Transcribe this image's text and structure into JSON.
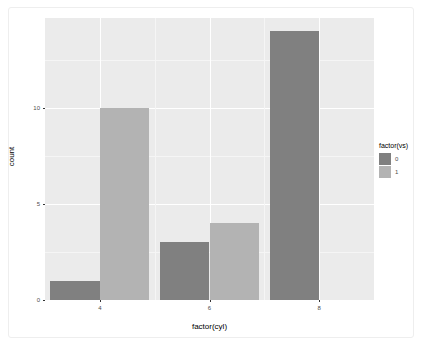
{
  "figure": {
    "background": "#ffffff",
    "panel_background": "#ebebeb",
    "grid_major_color": "#ffffff",
    "grid_minor_color": "#f5f5f5",
    "frame_border_color": "#eeeeee"
  },
  "axis": {
    "x_title": "factor(cyl)",
    "y_title": "count",
    "x_tick_labels": [
      "4",
      "6",
      "8"
    ],
    "y_tick_labels": [
      "0",
      "5",
      "10"
    ]
  },
  "legend": {
    "title": "factor(vs)",
    "position": "right",
    "items": [
      {
        "label": "0",
        "color": "#808080"
      },
      {
        "label": "1",
        "color": "#b3b3b3"
      }
    ]
  },
  "chart_data": {
    "type": "bar",
    "title": "",
    "subtitle": "",
    "xlabel": "factor(cyl)",
    "ylabel": "count",
    "categories": [
      "4",
      "6",
      "8"
    ],
    "series": [
      {
        "name": "0",
        "color": "#808080",
        "values": [
          1,
          3,
          14
        ]
      },
      {
        "name": "1",
        "color": "#b3b3b3",
        "values": [
          10,
          4,
          0
        ]
      }
    ],
    "ylim": [
      0,
      14.7
    ],
    "y_ticks": [
      0,
      5,
      10
    ],
    "y_minor_ticks": [
      2.5,
      7.5,
      12.5
    ],
    "grid": true,
    "grid_axis": "both",
    "legend_title": "factor(vs)",
    "legend_position": "right",
    "bar_mode": "dodge",
    "annotations": []
  }
}
